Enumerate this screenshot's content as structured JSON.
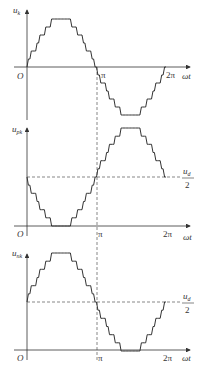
{
  "diagram": {
    "type": "waveform-stack",
    "panels": [
      {
        "id": "uk",
        "ylabel": "u",
        "ylabel_sub": "k",
        "origin_label": "O",
        "xlabel": "ωt",
        "x_ticks": [
          "π",
          "2π"
        ],
        "waveform": "stepped-sine",
        "offset_label": null
      },
      {
        "id": "upk",
        "ylabel": "u",
        "ylabel_sub": "pk",
        "origin_label": "O",
        "xlabel": "ωt",
        "x_ticks": [
          "π",
          "2π"
        ],
        "waveform": "stepped-negative-sine-plus-offset",
        "offset_label_num": "u",
        "offset_label_num_sub": "d",
        "offset_label_den": "2"
      },
      {
        "id": "unk",
        "ylabel": "u",
        "ylabel_sub": "nk",
        "origin_label": "O",
        "xlabel": "ωt",
        "x_ticks": [
          "π",
          "2π"
        ],
        "waveform": "stepped-sine-plus-offset",
        "offset_label_num": "u",
        "offset_label_num_sub": "d",
        "offset_label_den": "2"
      }
    ],
    "colors": {
      "line": "#333333",
      "dashed": "#555555",
      "background": "#ffffff"
    }
  }
}
